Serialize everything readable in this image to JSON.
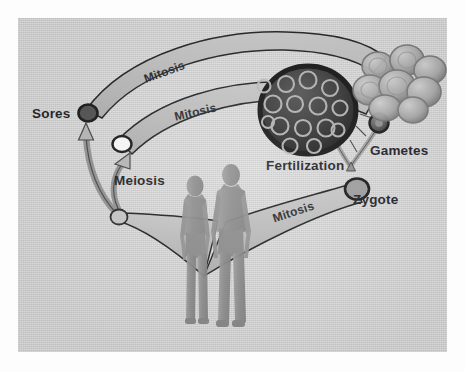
{
  "figure": {
    "kind": "life-cycle-diagram",
    "panel_background": "#d2d2d2",
    "page_background": "#ffffff",
    "ink_color": "#14161a",
    "band_fill": "#b9b9b9"
  },
  "labels": {
    "sores": "Sores",
    "meiosis": "Meiosis",
    "mitosis_top": "Mitosis",
    "mitosis_middle": "Mitosis",
    "mitosis_bottom": "Mitosis",
    "fertilization": "Fertilization",
    "gametes": "Gametes",
    "zygote": "Zygote"
  },
  "nodes": [
    {
      "name": "spore-cell",
      "label": "Sores",
      "fill": "#4a4a4a",
      "stroke": "#111111"
    },
    {
      "name": "haploid-cell",
      "label": "",
      "fill": "#fbfbfb",
      "stroke": "#111111"
    },
    {
      "name": "diploid-cell",
      "label": "",
      "fill": "#c9c9c9",
      "stroke": "#111111"
    },
    {
      "name": "zygote-cell",
      "label": "Zygote",
      "fill": "#9a9a9a",
      "stroke": "#111111"
    },
    {
      "name": "gamete-sperm",
      "label": "Gametes",
      "fill": "#5a5a5a",
      "stroke": "#111111"
    },
    {
      "name": "gamete-egg",
      "label": "Gametes",
      "fill": "#5a5a5a",
      "stroke": "#111111"
    },
    {
      "name": "sporangium-body",
      "label": "",
      "fill": "#2a2a2a",
      "stroke": "#050505"
    },
    {
      "name": "cell-cluster",
      "label": "",
      "fill": "#a7a7a7",
      "stroke": "#6d6d6d"
    },
    {
      "name": "human-female",
      "label": "",
      "fill": "#8d8d8d",
      "stroke": "#6a6a6a"
    },
    {
      "name": "human-male",
      "label": "",
      "fill": "#8d8d8d",
      "stroke": "#6a6a6a"
    }
  ],
  "processes": [
    {
      "name": "mitosis-top-arc",
      "label": "Mitosis",
      "from": "spore-cell",
      "to": "cell-cluster"
    },
    {
      "name": "mitosis-middle-arc",
      "label": "Mitosis",
      "from": "haploid-cell",
      "to": "sporangium-body"
    },
    {
      "name": "mitosis-bottom-arc",
      "label": "Mitosis",
      "from": "zygote-cell",
      "to": "human-male"
    },
    {
      "name": "meiosis-arrows",
      "label": "Meiosis",
      "from": "diploid-cell",
      "to": "spore-cell"
    },
    {
      "name": "fertilization-join",
      "label": "Fertilization",
      "from": "gamete-sperm",
      "to": "zygote-cell"
    }
  ]
}
